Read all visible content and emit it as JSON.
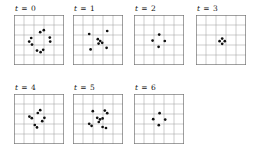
{
  "figure": {
    "name": "particle-grid-time-series",
    "grid": {
      "cols": 5,
      "rows": 5,
      "line_color": "#9a9a9a",
      "border_color": "#6e6e6e",
      "cell_px": 10
    },
    "dot": {
      "color": "#111111",
      "radius_px": 1.35
    },
    "background_color": "#ffffff",
    "text_color": "#141414"
  },
  "panels": [
    {
      "id": "t0",
      "label": {
        "var": "t",
        "op": "=",
        "value": "0",
        "full": "t = 0"
      },
      "row": 0,
      "col": 0,
      "dot_count": 10,
      "dots": [
        {
          "x": 2.62,
          "y": 1.72
        },
        {
          "x": 2.98,
          "y": 1.52
        },
        {
          "x": 1.72,
          "y": 2.3
        },
        {
          "x": 1.52,
          "y": 2.66
        },
        {
          "x": 1.8,
          "y": 2.96
        },
        {
          "x": 3.58,
          "y": 2.26
        },
        {
          "x": 3.62,
          "y": 2.66
        },
        {
          "x": 2.3,
          "y": 3.56
        },
        {
          "x": 2.66,
          "y": 3.72
        },
        {
          "x": 2.92,
          "y": 3.48
        }
      ]
    },
    {
      "id": "t1",
      "label": {
        "var": "t",
        "op": "=",
        "value": "1",
        "full": "t = 1"
      },
      "row": 0,
      "col": 1,
      "dot_count": 8,
      "dots": [
        {
          "x": 1.62,
          "y": 1.9
        },
        {
          "x": 3.42,
          "y": 1.6
        },
        {
          "x": 2.48,
          "y": 2.42
        },
        {
          "x": 2.72,
          "y": 2.6
        },
        {
          "x": 2.92,
          "y": 2.78
        },
        {
          "x": 2.56,
          "y": 2.86
        },
        {
          "x": 1.76,
          "y": 3.44
        },
        {
          "x": 3.36,
          "y": 3.28
        }
      ]
    },
    {
      "id": "t2",
      "label": {
        "var": "t",
        "op": "=",
        "value": "2",
        "full": "t = 2"
      },
      "row": 0,
      "col": 2,
      "dot_count": 4,
      "dots": [
        {
          "x": 2.52,
          "y": 1.96
        },
        {
          "x": 1.86,
          "y": 2.56
        },
        {
          "x": 3.08,
          "y": 2.6
        },
        {
          "x": 2.46,
          "y": 3.18
        }
      ]
    },
    {
      "id": "t3",
      "label": {
        "var": "t",
        "op": "=",
        "value": "3",
        "full": "t = 3"
      },
      "row": 0,
      "col": 3,
      "dot_count": 4,
      "dots": [
        {
          "x": 2.62,
          "y": 2.36
        },
        {
          "x": 2.36,
          "y": 2.62
        },
        {
          "x": 2.88,
          "y": 2.62
        },
        {
          "x": 2.62,
          "y": 2.88
        }
      ]
    },
    {
      "id": "t4",
      "label": {
        "var": "t",
        "op": "=",
        "value": "4",
        "full": "t = 4"
      },
      "row": 1,
      "col": 0,
      "dot_count": 8,
      "dots": [
        {
          "x": 2.62,
          "y": 1.62
        },
        {
          "x": 2.38,
          "y": 1.9
        },
        {
          "x": 1.54,
          "y": 2.26
        },
        {
          "x": 1.78,
          "y": 2.42
        },
        {
          "x": 3.04,
          "y": 2.38
        },
        {
          "x": 2.82,
          "y": 2.72
        },
        {
          "x": 2.08,
          "y": 3.1
        },
        {
          "x": 2.3,
          "y": 3.34
        }
      ]
    },
    {
      "id": "t5",
      "label": {
        "var": "t",
        "op": "=",
        "value": "5",
        "full": "t = 5"
      },
      "row": 1,
      "col": 1,
      "dot_count": 11,
      "dots": [
        {
          "x": 1.98,
          "y": 1.72
        },
        {
          "x": 3.18,
          "y": 1.66
        },
        {
          "x": 3.42,
          "y": 1.92
        },
        {
          "x": 2.42,
          "y": 2.38
        },
        {
          "x": 2.7,
          "y": 2.54
        },
        {
          "x": 2.96,
          "y": 2.44
        },
        {
          "x": 2.58,
          "y": 2.8
        },
        {
          "x": 1.62,
          "y": 2.98
        },
        {
          "x": 1.86,
          "y": 3.18
        },
        {
          "x": 2.96,
          "y": 3.3
        },
        {
          "x": 3.3,
          "y": 3.4
        }
      ]
    },
    {
      "id": "t6",
      "label": {
        "var": "t",
        "op": "=",
        "value": "6",
        "full": "t = 6"
      },
      "row": 1,
      "col": 2,
      "dot_count": 4,
      "dots": [
        {
          "x": 2.56,
          "y": 1.92
        },
        {
          "x": 1.92,
          "y": 2.52
        },
        {
          "x": 3.12,
          "y": 2.56
        },
        {
          "x": 2.48,
          "y": 3.12
        }
      ]
    }
  ]
}
